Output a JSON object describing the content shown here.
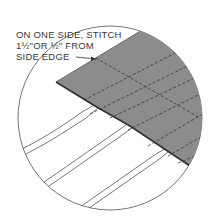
{
  "illustration": {
    "callout": {
      "lines": [
        "ON ONE SIDE, STITCH",
        "1½\"OR ½\" FROM",
        "SIDE EDGE"
      ]
    },
    "colors": {
      "fabric": "#8c8c8c",
      "outline": "#555555",
      "stitch": "#3a3a3a",
      "background": "#ffffff"
    }
  }
}
